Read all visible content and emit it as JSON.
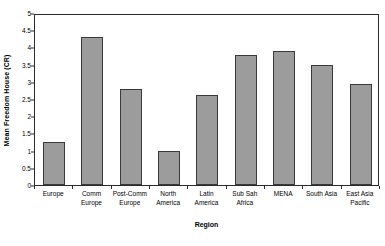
{
  "chart_data": {
    "type": "bar",
    "title": "",
    "xlabel": "Region",
    "ylabel": "Mean Freedom House (CR)",
    "categories": [
      "Europe",
      "Comm Europe",
      "Post-Comm Europe",
      "North America",
      "Latin America",
      "Sub Sah Africa",
      "MENA",
      "South Asia",
      "East Asia Pacific"
    ],
    "category_lines": [
      [
        "Europe"
      ],
      [
        "Comm",
        "Europe"
      ],
      [
        "Post-Comm",
        "Europe"
      ],
      [
        "North",
        "America"
      ],
      [
        "Latin",
        "America"
      ],
      [
        "Sub Sah",
        "Africa"
      ],
      [
        "MENA"
      ],
      [
        "South Asia"
      ],
      [
        "East Asia",
        "Pacific"
      ]
    ],
    "values": [
      1.25,
      4.3,
      2.78,
      1.0,
      2.61,
      3.78,
      3.89,
      3.48,
      2.94
    ],
    "ylim": [
      0,
      5
    ],
    "ytick_step": 0.5,
    "ytick_labels": [
      "0",
      "0.5",
      "1",
      "1.5",
      "2",
      "2.5",
      "3",
      "3.5",
      "4",
      "4.5",
      "5"
    ],
    "ytick_values": [
      0,
      0.5,
      1,
      1.5,
      2,
      2.5,
      3,
      3.5,
      4,
      4.5,
      5
    ],
    "grid": false,
    "legend": "none",
    "bar_fill_color": "#9c9c9c",
    "bar_border_color": "#3a3a3a",
    "axis_color": "#2b2b2b",
    "background_color": "#ffffff"
  }
}
